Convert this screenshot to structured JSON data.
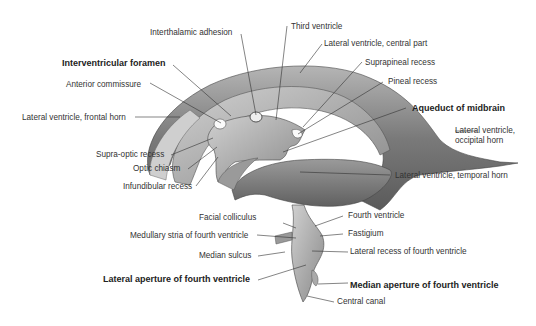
{
  "figure": {
    "colors": {
      "structure_dark": "#5e5e5e",
      "structure_mid": "#8c8c8c",
      "structure_light": "#c8c8c8",
      "leader": "#333333",
      "text": "#333333"
    }
  },
  "labels": {
    "interthalamic_adhesion": "Interthalamic adhesion",
    "third_ventricle": "Third ventricle",
    "lateral_ventricle_central_part": "Lateral ventricle, central part",
    "interventricular_foramen": "Interventricular foramen",
    "suprapineal_recess": "Suprapineal recess",
    "anterior_commissure": "Anterior commissure",
    "pineal_recess": "Pineal recess",
    "aqueduct_of_midbrain": "Aqueduct of midbrain",
    "lateral_ventricle_frontal_horn": "Lateral ventricle, frontal horn",
    "lateral_ventricle_occipital_horn_1": "Lateral ventricle,",
    "lateral_ventricle_occipital_horn_2": "occipital horn",
    "supra_optic_recess": "Supra-optic recess",
    "optic_chiasm": "Optic chiasm",
    "infundibular_recess": "Infundibular recess",
    "lateral_ventricle_temporal_horn": "Lateral ventricle, temporal horn",
    "facial_colliculus": "Facial colliculus",
    "fourth_ventricle": "Fourth ventricle",
    "medullary_stria": "Medullary stria of fourth ventricle",
    "fastigium": "Fastigium",
    "median_sulcus": "Median sulcus",
    "lateral_recess": "Lateral recess of fourth ventricle",
    "lateral_aperture": "Lateral aperture of fourth ventricle",
    "median_aperture": "Median aperture of fourth ventricle",
    "central_canal": "Central canal"
  }
}
